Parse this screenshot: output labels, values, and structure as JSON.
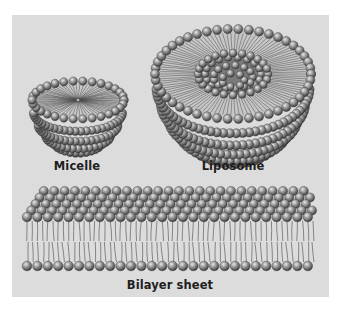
{
  "figure": {
    "background": "#dcdcdc",
    "head_color": "#8a8a8a",
    "tail_color": "#3a3a3a",
    "structures": [
      {
        "name": "micelle",
        "label": "Micelle"
      },
      {
        "name": "liposome",
        "label": "Liposome"
      },
      {
        "name": "bilayer",
        "label": "Bilayer sheet"
      }
    ]
  },
  "labels": {
    "micelle": "Micelle",
    "liposome": "Liposome",
    "bilayer": "Bilayer sheet"
  }
}
